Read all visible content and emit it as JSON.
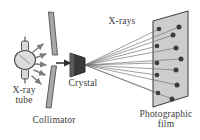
{
  "figure": {
    "background_color": "#ffffff"
  },
  "labels": {
    "xray_tube": "X-ray\ntube",
    "collimator": "Collimator",
    "crystal": "Crystal",
    "xrays": "X-rays",
    "photographic_film": "Photographic\nfilm"
  },
  "colors": {
    "text": "#3b3b3b",
    "tube_fill": "#d8d8d8",
    "tube_stroke": "#4a4a4a",
    "collimator_fill": "#a8a8a8",
    "collimator_stroke": "#4f4f4f",
    "crystal_fill": "#3a3a3a",
    "crystal_stroke": "#222222",
    "beam_stroke": "#2e2e2e",
    "ray_stroke": "#6e6e6e",
    "film_fill": "#cdcdcd",
    "film_stroke": "#4a4a4a",
    "spot_fill": "#3c3c3c",
    "arrow_fill": "#7d7d7d"
  },
  "components": {
    "xray_tube": {
      "name": "X-ray tube",
      "center_x": 25,
      "center_y": 60,
      "bulb_rx": 10,
      "bulb_ry": 9,
      "emission_arrow_count": 5
    },
    "collimator": {
      "name": "Collimator",
      "upper_bar": {
        "x1": 50,
        "y1": 12,
        "x2": 55,
        "y2": 55
      },
      "lower_bar": {
        "x1": 50,
        "y1": 66,
        "x2": 46,
        "y2": 108
      },
      "slit_gap_y": 60
    },
    "crystal": {
      "name": "Crystal",
      "apex_x": 85,
      "apex_y": 65,
      "base_x": 70,
      "half_height": 13
    },
    "incident_beam": {
      "from_x": 56,
      "from_y": 63,
      "to_x": 72,
      "to_y": 63
    },
    "photographic_film": {
      "name": "Photographic film",
      "corners": [
        {
          "x": 153,
          "y": 21
        },
        {
          "x": 188,
          "y": 11
        },
        {
          "x": 188,
          "y": 96
        },
        {
          "x": 153,
          "y": 107
        }
      ]
    }
  },
  "diffraction_spots": [
    {
      "x": 159,
      "y": 29,
      "r": 2.3,
      "column": "left"
    },
    {
      "x": 157,
      "y": 46,
      "r": 2.3,
      "column": "left"
    },
    {
      "x": 157,
      "y": 63,
      "r": 2.3,
      "column": "left"
    },
    {
      "x": 157,
      "y": 75,
      "r": 2.3,
      "column": "left"
    },
    {
      "x": 158,
      "y": 93,
      "r": 2.3,
      "column": "left"
    },
    {
      "x": 173,
      "y": 35,
      "r": 2.5,
      "column": "right"
    },
    {
      "x": 179,
      "y": 27,
      "r": 2.5,
      "column": "right"
    },
    {
      "x": 176,
      "y": 48,
      "r": 2.5,
      "column": "right"
    },
    {
      "x": 181,
      "y": 59,
      "r": 2.5,
      "column": "right"
    },
    {
      "x": 176,
      "y": 70,
      "r": 2.5,
      "column": "right"
    },
    {
      "x": 177,
      "y": 85,
      "r": 2.5,
      "column": "right"
    },
    {
      "x": 172,
      "y": 99,
      "r": 2.5,
      "column": "right"
    }
  ],
  "diffracted_rays": [
    {
      "x1": 85,
      "y1": 65,
      "x2": 159,
      "y2": 29
    },
    {
      "x1": 85,
      "y1": 65,
      "x2": 179,
      "y2": 27
    },
    {
      "x1": 85,
      "y1": 65,
      "x2": 173,
      "y2": 35
    },
    {
      "x1": 85,
      "y1": 65,
      "x2": 157,
      "y2": 46
    },
    {
      "x1": 85,
      "y1": 65,
      "x2": 176,
      "y2": 48
    },
    {
      "x1": 85,
      "y1": 65,
      "x2": 181,
      "y2": 59
    },
    {
      "x1": 85,
      "y1": 65,
      "x2": 157,
      "y2": 63
    },
    {
      "x1": 85,
      "y1": 65,
      "x2": 176,
      "y2": 70
    },
    {
      "x1": 85,
      "y1": 65,
      "x2": 157,
      "y2": 75
    },
    {
      "x1": 85,
      "y1": 65,
      "x2": 177,
      "y2": 85
    },
    {
      "x1": 85,
      "y1": 65,
      "x2": 158,
      "y2": 93
    },
    {
      "x1": 85,
      "y1": 65,
      "x2": 172,
      "y2": 99
    }
  ],
  "emission_arrows": [
    {
      "x1": 33,
      "y1": 52,
      "x2": 43,
      "y2": 44
    },
    {
      "x1": 35,
      "y1": 58,
      "x2": 46,
      "y2": 54
    },
    {
      "x1": 35,
      "y1": 64,
      "x2": 46,
      "y2": 65
    },
    {
      "x1": 34,
      "y1": 70,
      "x2": 45,
      "y2": 75
    },
    {
      "x1": 32,
      "y1": 76,
      "x2": 41,
      "y2": 84
    }
  ]
}
